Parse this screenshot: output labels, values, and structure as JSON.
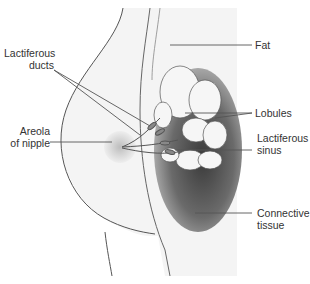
{
  "diagram": {
    "colors": {
      "background_panel": "#e6e6e6",
      "skin_fill": "#f2f2f2",
      "outline": "#555555",
      "connective_dark": "#6a6a6a",
      "areola": "#d8d8d8",
      "label_text": "#333333",
      "leader_line": "#555555"
    },
    "labels": {
      "lactiferous_ducts_line1": "Lactiferous",
      "lactiferous_ducts_line2": "ducts",
      "areola_line1": "Areola",
      "areola_line2": "of nipple",
      "fat": "Fat",
      "lobules": "Lobules",
      "lactiferous_sinus_line1": "Lactiferous",
      "lactiferous_sinus_line2": "sinus",
      "connective_line1": "Connective",
      "connective_line2": "tissue"
    }
  }
}
